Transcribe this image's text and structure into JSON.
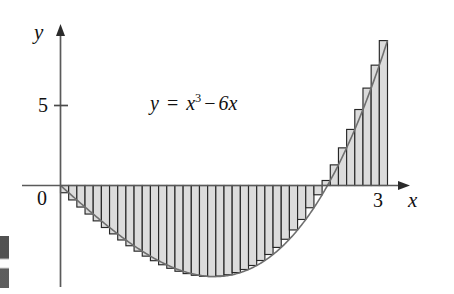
{
  "figure": {
    "kind": "riemann-sum-diagram",
    "equation": {
      "lhs": "y",
      "eq": "=",
      "base": "x",
      "exponent": "3",
      "operator": "−",
      "term": "6x"
    },
    "axis_labels": {
      "x": "x",
      "y": "y"
    },
    "tick_labels": {
      "y_five": "5",
      "origin": "0",
      "x_three": "3"
    },
    "colors": {
      "rect_fill": "#dcdcdc",
      "rect_stroke": "#262626",
      "curve": "#6f6f6f",
      "axis": "#5a5a5a",
      "text": "#111111",
      "background": "#ffffff"
    }
  },
  "chart_data": {
    "type": "area",
    "title": "",
    "subtitle": "",
    "xlabel": "x",
    "ylabel": "y",
    "function": "y = x^3 - 6x",
    "grid": false,
    "legend": null,
    "annotations": [
      "y = x³ − 6x"
    ],
    "xlim": [
      -0.18,
      3.55
    ],
    "ylim": [
      -7.3,
      10.4
    ],
    "xticks": [
      0,
      3
    ],
    "xtick_labels": [
      "0",
      "3"
    ],
    "yticks": [
      5
    ],
    "ytick_labels": [
      "5"
    ],
    "riemann": {
      "method": "right-endpoint",
      "n": 40,
      "a": 0,
      "b": 3,
      "dx": 0.075,
      "signed_area_exact": -7.875
    },
    "x": [
      0,
      0.15,
      0.3,
      0.45,
      0.6,
      0.75,
      0.9,
      1.05,
      1.2,
      1.35,
      1.5,
      1.65,
      1.8,
      1.95,
      2.1,
      2.25,
      2.4,
      2.55,
      2.7,
      2.85,
      3
    ],
    "y": [
      0,
      -0.897,
      -1.773,
      -2.609,
      -3.384,
      -4.078,
      -4.671,
      -5.142,
      -4.752,
      -5.639,
      -5.625,
      -5.407,
      -4.968,
      -4.287,
      -3.339,
      -2.109,
      -0.576,
      1.28,
      3.48,
      6.046,
      9
    ],
    "curve_points_note": "y evaluated at x = k*0.15 for k = 0..20 on y = x^3 - 6x",
    "roots": [
      0,
      2.449
    ],
    "minimum": {
      "x": 1.414,
      "y": -5.657
    }
  }
}
